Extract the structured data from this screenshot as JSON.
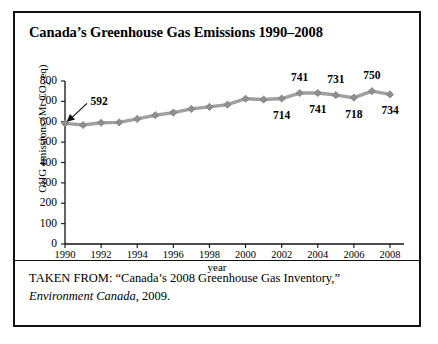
{
  "figure": {
    "title": "Canada’s Greenhouse Gas Emissions 1990–2008",
    "source_prefix": "TAKEN FROM: “Canada’s 2008 Greenhouse Gas Inventory,”",
    "source_publisher": "Environment Canada",
    "source_year": ", 2009.",
    "colors": {
      "line": "#a0a0a0",
      "marker": "#8f8f8f",
      "axis": "#111111",
      "text": "#000000",
      "border": "#111111"
    }
  },
  "chart_data": {
    "type": "line",
    "title": "Canada’s Greenhouse Gas Emissions 1990–2008",
    "xlabel": "year",
    "ylabel": "GHG emissions (Mt CO2 eq)",
    "ylabel_parts": {
      "before": "GHG emissions (Mt CO",
      "sub": "2",
      "after": " eq)"
    },
    "xlim": [
      1990,
      2008
    ],
    "ylim": [
      0,
      800
    ],
    "y_ticks": [
      800,
      700,
      600,
      500,
      400,
      300,
      200,
      100,
      0
    ],
    "x_ticks": [
      1990,
      1992,
      1994,
      1996,
      1998,
      2000,
      2002,
      2004,
      2006,
      2008
    ],
    "grid": false,
    "legend": false,
    "x": [
      1990,
      1991,
      1992,
      1993,
      1994,
      1995,
      1996,
      1997,
      1998,
      1999,
      2000,
      2001,
      2002,
      2003,
      2004,
      2005,
      2006,
      2007,
      2008
    ],
    "values": [
      592,
      584,
      595,
      597,
      614,
      632,
      645,
      663,
      673,
      684,
      713,
      709,
      714,
      741,
      741,
      731,
      718,
      750,
      734
    ],
    "annotations": [
      {
        "year": 1990,
        "value": 592,
        "label": "592",
        "position": "arrow-upper-right"
      },
      {
        "year": 2002,
        "value": 714,
        "label": "714",
        "position": "below"
      },
      {
        "year": 2003,
        "value": 741,
        "label": "741",
        "position": "above"
      },
      {
        "year": 2004,
        "value": 741,
        "label": "741",
        "position": "below"
      },
      {
        "year": 2005,
        "value": 731,
        "label": "731",
        "position": "above"
      },
      {
        "year": 2006,
        "value": 718,
        "label": "718",
        "position": "below"
      },
      {
        "year": 2007,
        "value": 750,
        "label": "750",
        "position": "above"
      },
      {
        "year": 2008,
        "value": 734,
        "label": "734",
        "position": "below"
      }
    ]
  }
}
